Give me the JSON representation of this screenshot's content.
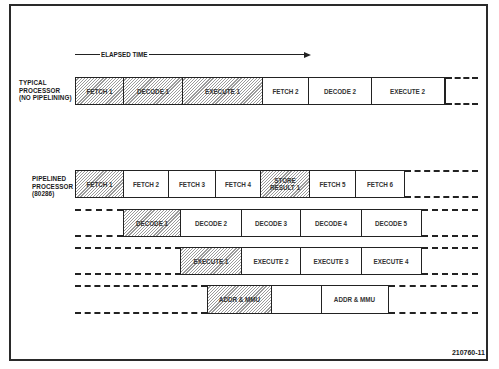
{
  "diagram": {
    "timeline_label": "ELAPSED TIME",
    "figure_number": "210760-11",
    "hatch_color": "#9a9a9a",
    "line_color": "#222222",
    "typical": {
      "label_lines": [
        "TYPICAL",
        "PROCESSOR",
        "(NO PIPELINING)"
      ],
      "cells": [
        {
          "text": "FETCH 1",
          "hatched": true
        },
        {
          "text": "DECODE 1",
          "hatched": true
        },
        {
          "text": "EXECUTE 1",
          "hatched": true
        },
        {
          "text": "FETCH 2",
          "hatched": false
        },
        {
          "text": "DECODE 2",
          "hatched": false
        },
        {
          "text": "EXECUTE 2",
          "hatched": false
        }
      ]
    },
    "pipelined": {
      "label_lines": [
        "PIPELINED",
        "PROCESSOR",
        "(80286)"
      ],
      "rows": [
        {
          "name": "bus-unit",
          "cells": [
            {
              "text": "FETCH 1",
              "hatched": true
            },
            {
              "text": "FETCH 2",
              "hatched": false
            },
            {
              "text": "FETCH 3",
              "hatched": false
            },
            {
              "text": "FETCH 4",
              "hatched": false
            },
            {
              "text": "STORE RESULT 1",
              "line1": "STORE",
              "line2": "RESULT 1",
              "hatched": true
            },
            {
              "text": "FETCH 5",
              "hatched": false
            },
            {
              "text": "FETCH 6",
              "hatched": false
            }
          ]
        },
        {
          "name": "instruction-unit",
          "cells": [
            {
              "text": "DECODE 1",
              "hatched": true
            },
            {
              "text": "DECODE 2",
              "hatched": false
            },
            {
              "text": "DECODE 3",
              "hatched": false
            },
            {
              "text": "DECODE 4",
              "hatched": false
            },
            {
              "text": "DECODE 5",
              "hatched": false
            }
          ]
        },
        {
          "name": "execution-unit",
          "cells": [
            {
              "text": "EXECUTE 1",
              "hatched": true
            },
            {
              "text": "EXECUTE 2",
              "hatched": false
            },
            {
              "text": "EXECUTE 3",
              "hatched": false
            },
            {
              "text": "EXECUTE 4",
              "hatched": false
            }
          ]
        },
        {
          "name": "address-unit",
          "cells": [
            {
              "text": "ADDR & MMU",
              "hatched": true
            },
            {
              "text": "",
              "hatched": false
            },
            {
              "text": "ADDR & MMU",
              "hatched": false
            }
          ]
        }
      ]
    }
  }
}
